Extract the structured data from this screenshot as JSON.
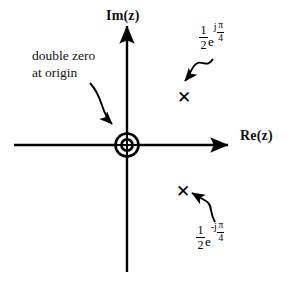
{
  "figure": {
    "background": "#ffffff",
    "ink": "#000000"
  },
  "axes": {
    "imaginary_label": "Im(z)",
    "real_label": "Re(z)",
    "origin_px": [
      127,
      145
    ],
    "vertical_span_px": [
      22,
      272
    ],
    "horizontal_span_px": [
      14,
      232
    ]
  },
  "annotations": {
    "origin_note_line1": "double zero",
    "origin_note_line2": "at origin",
    "origin_note": "double zero at origin"
  },
  "zeros": [
    {
      "name": "double-zero-origin",
      "marker": "double-circle",
      "multiplicity": 2,
      "location": "origin",
      "position_px": [
        127,
        145
      ]
    }
  ],
  "poles": [
    {
      "name": "pole-upper",
      "marker": "x",
      "glyph": "✕",
      "magnitude_num": "1",
      "magnitude_den": "2",
      "base": "e",
      "exponent_sign": "j",
      "angle_num": "π",
      "angle_den": "4",
      "expression": "(1/2)e^{jπ/4}",
      "position_px": [
        184,
        98
      ]
    },
    {
      "name": "pole-lower",
      "marker": "x",
      "glyph": "✕",
      "magnitude_num": "1",
      "magnitude_den": "2",
      "base": "e",
      "exponent_sign": "-j",
      "angle_num": "π",
      "angle_den": "4",
      "expression": "(1/2)e^{-jπ/4}",
      "position_px": [
        183,
        192
      ]
    }
  ]
}
